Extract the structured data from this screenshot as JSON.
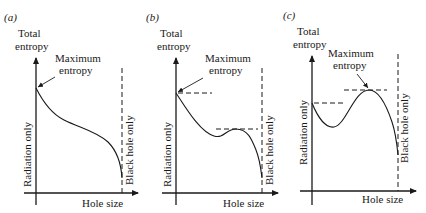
{
  "figure": {
    "panels": [
      {
        "id": "a",
        "label": "(a)",
        "y_axis_label_line1": "Total",
        "y_axis_label_line2": "entropy",
        "x_axis_label": "Hole size",
        "left_vertical_label": "Radiation only",
        "right_vertical_label": "Black hole only",
        "annotation_line1": "Maximum",
        "annotation_line2": "entropy",
        "description": "Monotonically decreasing entropy; maximum at radiation only"
      },
      {
        "id": "b",
        "label": "(b)",
        "y_axis_label_line1": "Total",
        "y_axis_label_line2": "entropy",
        "x_axis_label": "Hole size",
        "left_vertical_label": "Radiation only",
        "right_vertical_label": "Black hole only",
        "annotation_line1": "Maximum",
        "annotation_line2": "entropy",
        "description": "Global maximum at radiation only, with a lower local maximum at intermediate hole size"
      },
      {
        "id": "c",
        "label": "(c)",
        "y_axis_label_line1": "Total",
        "y_axis_label_line2": "entropy",
        "x_axis_label": "Hole size",
        "left_vertical_label": "Radiation only",
        "right_vertical_label": "Black hole only",
        "annotation_line1": "Maximum",
        "annotation_line2": "entropy",
        "description": "Global maximum at intermediate hole size, higher than radiation-only value"
      }
    ]
  }
}
